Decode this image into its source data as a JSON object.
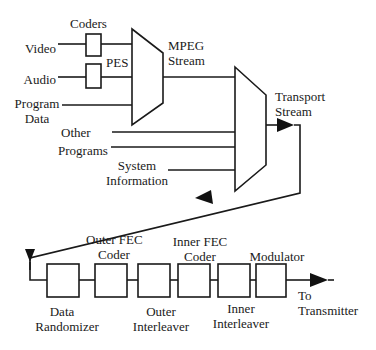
{
  "diagram": {
    "type": "block-diagram",
    "inputs": {
      "video": "Video",
      "audio": "Audio",
      "program_data": [
        "Program",
        "Data"
      ],
      "other_programs": [
        "Other",
        "Programs"
      ],
      "system_information": [
        "System",
        "Information"
      ]
    },
    "labels": {
      "coders": "Coders",
      "pes": "PES",
      "mpeg_stream": [
        "MPEG",
        "Stream"
      ],
      "transport_stream": [
        "Transport",
        "Stream"
      ]
    },
    "chain_blocks": [
      {
        "id": "data-randomizer",
        "label": [
          "Data",
          "Randomizer"
        ],
        "label_pos": "below"
      },
      {
        "id": "outer-fec-coder",
        "label": [
          "Outer FEC",
          "Coder"
        ],
        "label_pos": "above"
      },
      {
        "id": "outer-interleaver",
        "label": [
          "Outer",
          "Interleaver"
        ],
        "label_pos": "below"
      },
      {
        "id": "inner-fec-coder",
        "label": [
          "Inner FEC",
          "Coder"
        ],
        "label_pos": "above"
      },
      {
        "id": "inner-interleaver",
        "label": [
          "Inner",
          "Interleaver"
        ],
        "label_pos": "below"
      },
      {
        "id": "modulator",
        "label": [
          "Modulator"
        ],
        "label_pos": "above"
      }
    ],
    "output": [
      "To",
      "Transmitter"
    ],
    "colors": {
      "stroke": "#1a1a1a",
      "background": "#ffffff"
    }
  }
}
